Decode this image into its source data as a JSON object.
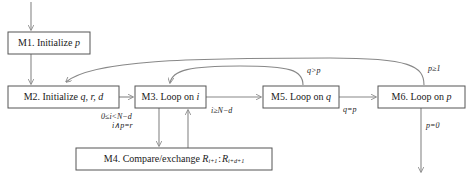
{
  "diagram": {
    "type": "flowchart",
    "colors": {
      "box_stroke": "#555555",
      "box_fill": "#ffffff",
      "edge_stroke": "#888888",
      "text": "#1a1a1a",
      "background": "#ffffff"
    },
    "nodes": [
      {
        "id": "M1",
        "label": "M1. Initialize p",
        "prefix": "M1. Initialize ",
        "var": "p",
        "x": 8,
        "y": 32,
        "w": 82,
        "h": 22
      },
      {
        "id": "M2",
        "label": "M2. Initialize q, r, d",
        "prefix": "M2. Initialize ",
        "var": "q, r, d",
        "x": 8,
        "y": 86,
        "w": 111,
        "h": 22
      },
      {
        "id": "M3",
        "label": "M3. Loop on i",
        "prefix": "M3. Loop on ",
        "var": "i",
        "x": 135,
        "y": 86,
        "w": 71,
        "h": 22
      },
      {
        "id": "M4",
        "label": "M4. Compare/exchange R(i+1) : R(i+d+1)",
        "prefix": "M4. Compare/exchange ",
        "var": "R_{i+1} : R_{i+d+1}",
        "x": 76,
        "y": 148,
        "w": 196,
        "h": 22
      },
      {
        "id": "M5",
        "label": "M5. Loop on q",
        "prefix": "M5. Loop on ",
        "var": "q",
        "x": 263,
        "y": 86,
        "w": 76,
        "h": 22
      },
      {
        "id": "M6",
        "label": "M6. Loop on p",
        "prefix": "M6. Loop on ",
        "var": "p",
        "x": 378,
        "y": 86,
        "w": 87,
        "h": 22
      }
    ],
    "edge_labels": {
      "m3_to_m4_line1": "0≤i<N−d",
      "m3_to_m4_line2": "i∧p=r",
      "m3_to_m5": "i≥N−d",
      "m5_to_m3": "q>p",
      "m5_to_m6": "q=p",
      "m6_to_m2": "p≥1",
      "m6_exit": "p=0"
    },
    "edges": [
      {
        "from": "start",
        "to": "M1",
        "label": ""
      },
      {
        "from": "M1",
        "to": "M2",
        "label": ""
      },
      {
        "from": "M2",
        "to": "M3",
        "label": ""
      },
      {
        "from": "M3",
        "to": "M4",
        "label": "0≤i<N−d / i∧p=r"
      },
      {
        "from": "M4",
        "to": "M3",
        "label": ""
      },
      {
        "from": "M3",
        "to": "M5",
        "label": "i≥N−d"
      },
      {
        "from": "M5",
        "to": "M3",
        "label": "q>p"
      },
      {
        "from": "M5",
        "to": "M6",
        "label": "q=p"
      },
      {
        "from": "M6",
        "to": "M2",
        "label": "p≥1"
      },
      {
        "from": "M6",
        "to": "end",
        "label": "p=0"
      }
    ]
  }
}
